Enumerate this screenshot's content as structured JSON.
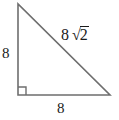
{
  "figure": {
    "type": "right-triangle-diagram",
    "background_color": "#ffffff",
    "stroke_color": "#6e6e6e",
    "text_color": "#1a1a1a",
    "vertices": {
      "top": [
        18,
        4
      ],
      "bottom_left": [
        18,
        95
      ],
      "bottom_right": [
        110,
        95
      ]
    },
    "right_angle_marker": {
      "name": "right-angle-marker",
      "at_vertex": "bottom_left",
      "size": 8
    },
    "labels": {
      "leg_vertical": "8",
      "leg_horizontal": "8",
      "hypotenuse_coefficient": "8",
      "hypotenuse_radical_sign": "√",
      "hypotenuse_radicand": "2",
      "hypotenuse_full": "8 √2"
    }
  }
}
